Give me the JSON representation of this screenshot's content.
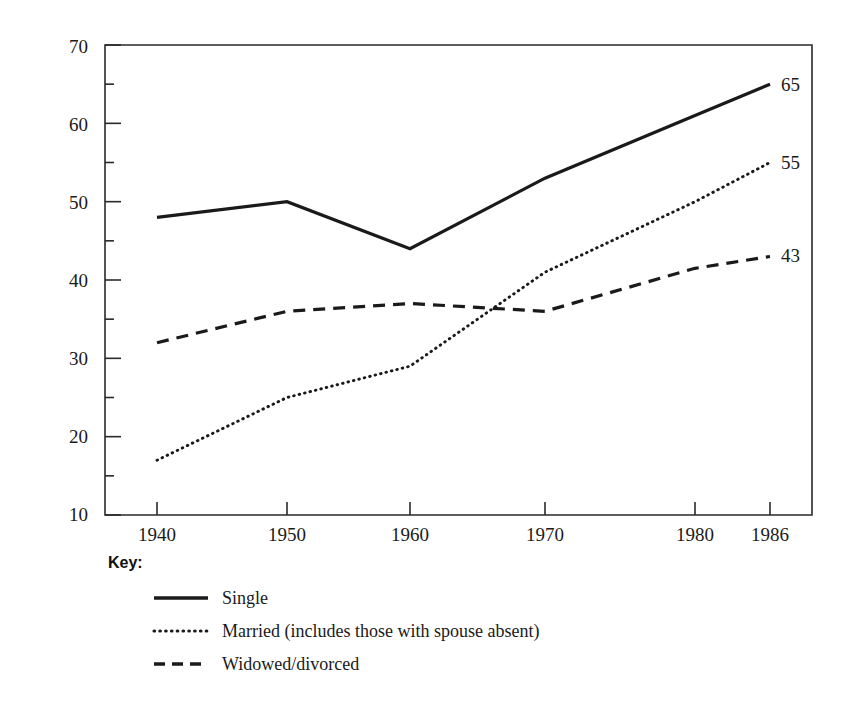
{
  "chart_data": {
    "type": "line",
    "title": "",
    "xlabel": "",
    "ylabel": "Percentage of Women in Labor Force",
    "xlim": [
      1940,
      1986
    ],
    "ylim": [
      10,
      70
    ],
    "grid": false,
    "legend_position": "below-left",
    "x": [
      1940,
      1950,
      1960,
      1970,
      1980,
      1986
    ],
    "xtick_labels": [
      "1940",
      "1950",
      "1960",
      "1970",
      "1980",
      "1986"
    ],
    "ytick_labels": [
      "10",
      "20",
      "30",
      "40",
      "50",
      "60",
      "70"
    ],
    "ytick_values": [
      10,
      20,
      30,
      40,
      50,
      60,
      70
    ],
    "yminor_values": [
      15,
      25,
      35,
      45,
      55,
      65
    ],
    "series": [
      {
        "name": "Single",
        "style": "solid",
        "color": "#1a1a1a",
        "values": [
          48,
          50,
          44,
          53,
          61,
          65
        ],
        "end_label": "65"
      },
      {
        "name": "Married (includes those with spouse absent)",
        "style": "dotted",
        "color": "#1a1a1a",
        "values": [
          17,
          25,
          29,
          41,
          50,
          55
        ],
        "end_label": "55"
      },
      {
        "name": "Widowed/divorced",
        "style": "dashed",
        "color": "#1a1a1a",
        "values": [
          32,
          36,
          37,
          36,
          41.5,
          43
        ],
        "end_label": "43"
      }
    ]
  },
  "axis": {
    "y_label": "Percentage of Women in Labor Force",
    "y_ticks": [
      "70",
      "60",
      "50",
      "40",
      "30",
      "20",
      "10"
    ],
    "x_ticks": [
      "1940",
      "1950",
      "1960",
      "1970",
      "1980",
      "1986"
    ]
  },
  "end_labels": {
    "single": "65",
    "married": "55",
    "widowed": "43"
  },
  "legend": {
    "title": "Key:",
    "items": [
      {
        "label": "Single",
        "style": "solid"
      },
      {
        "label": "Married (includes those with spouse absent)",
        "style": "dotted"
      },
      {
        "label": "Widowed/divorced",
        "style": "dashed"
      }
    ]
  }
}
